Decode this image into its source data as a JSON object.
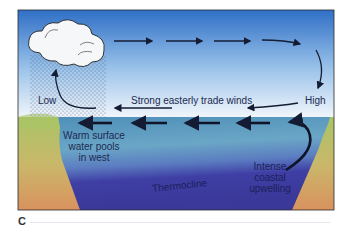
{
  "figure": {
    "panel_letter": "C",
    "colors": {
      "sky_top": "#2f6fc6",
      "sky_bottom": "#f2f6fb",
      "warm_water": "#5a9cc0",
      "cold_water": "#3b3aa0",
      "land_top": "#a8c266",
      "land_bottom": "#d7955e",
      "arrow": "#141c33",
      "text": "#1d2a52"
    },
    "labels": {
      "low": "Low",
      "high": "High",
      "trade_winds": "Strong easterly trade winds",
      "warm_pool_line1": "Warm surface",
      "warm_pool_line2": "water pools",
      "warm_pool_line3": "in west",
      "thermocline": "Thermocline",
      "upwelling_line1": "Intense",
      "upwelling_line2": "coastal",
      "upwelling_line3": "upwelling"
    },
    "icons": [
      "cloud-icon",
      "rain-icon"
    ]
  }
}
